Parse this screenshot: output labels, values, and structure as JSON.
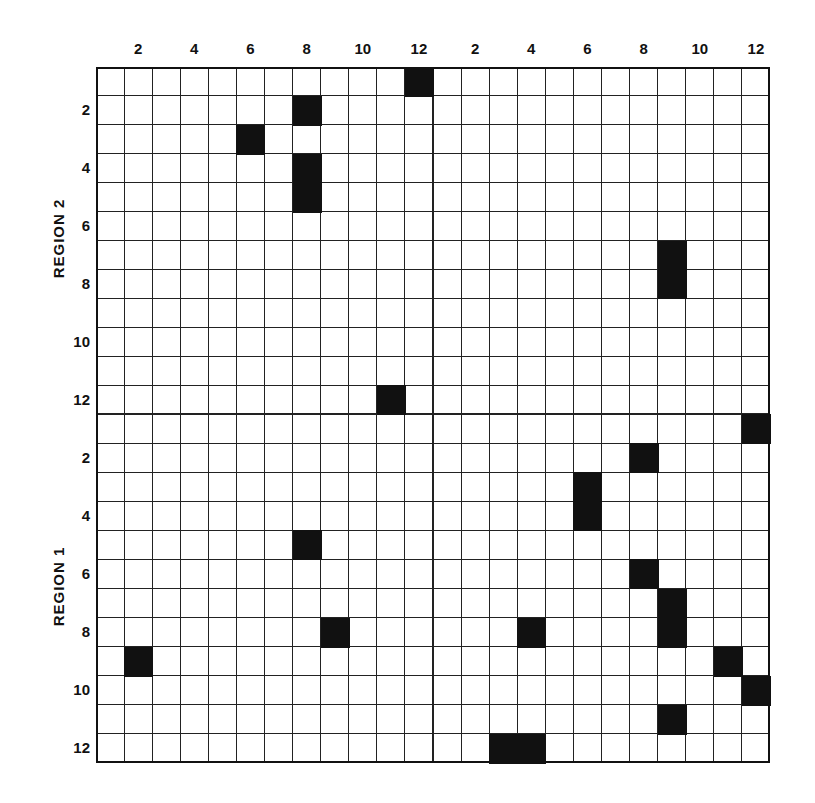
{
  "chart_data": {
    "type": "heatmap",
    "title": "",
    "x_tick_labels_left": [
      "2",
      "4",
      "6",
      "8",
      "10",
      "12"
    ],
    "x_tick_labels_right": [
      "2",
      "4",
      "6",
      "8",
      "10",
      "12"
    ],
    "y_tick_labels_region2": [
      "2",
      "4",
      "6",
      "8",
      "10",
      "12"
    ],
    "y_tick_labels_region1": [
      "2",
      "4",
      "6",
      "8",
      "10",
      "12"
    ],
    "row_groups": [
      "REGION 2",
      "REGION 1"
    ],
    "grid_size": {
      "cols": 24,
      "rows": 24,
      "quadrant": 12
    },
    "filled_cells": {
      "region2_left": [
        [
          12,
          1
        ],
        [
          8,
          2
        ],
        [
          6,
          3
        ],
        [
          8,
          4
        ],
        [
          8,
          5
        ],
        [
          11,
          12
        ]
      ],
      "region2_right": [
        [
          9,
          7
        ],
        [
          9,
          8
        ]
      ],
      "region1_left": [
        [
          8,
          5
        ],
        [
          9,
          8
        ],
        [
          2,
          9
        ]
      ],
      "region1_right": [
        [
          12,
          1
        ],
        [
          8,
          2
        ],
        [
          6,
          3
        ],
        [
          6,
          4
        ],
        [
          8,
          6
        ],
        [
          9,
          7
        ],
        [
          9,
          8
        ],
        [
          4,
          8
        ],
        [
          11,
          9
        ],
        [
          12,
          10
        ],
        [
          9,
          11
        ],
        [
          3,
          12
        ],
        [
          4,
          12
        ]
      ]
    },
    "cell_format": "[column, row] within quadrant, 1-indexed",
    "grid": "on",
    "legend": "none"
  },
  "labels": {
    "region2": "REGION 2",
    "region1": "REGION 1"
  },
  "colors": {
    "filled": "#111111",
    "empty": "#ffffff",
    "lines": "#222222"
  }
}
